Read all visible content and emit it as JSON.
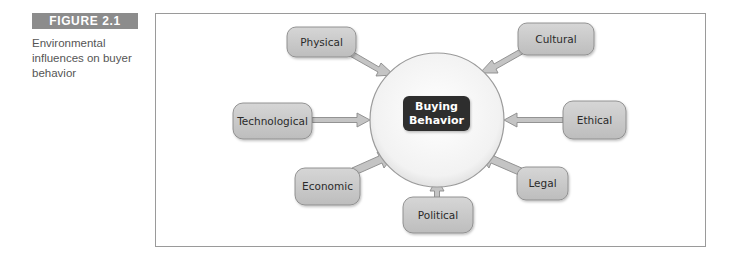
{
  "figure": {
    "label": "FIGURE 2.1",
    "caption": "Environmental influences on buyer behavior"
  },
  "diagram": {
    "center": {
      "line1": "Buying",
      "line2": "Behavior"
    },
    "influences": [
      {
        "id": "physical",
        "label": "Physical"
      },
      {
        "id": "cultural",
        "label": "Cultural"
      },
      {
        "id": "technological",
        "label": "Technological"
      },
      {
        "id": "ethical",
        "label": "Ethical"
      },
      {
        "id": "economic",
        "label": "Economic"
      },
      {
        "id": "legal",
        "label": "Legal"
      },
      {
        "id": "political",
        "label": "Political"
      }
    ]
  },
  "colors": {
    "label_bg": "#8c8c8c",
    "node_fill": "#c9c9c9",
    "node_stroke": "#8a8a8a",
    "center_fill": "#2f2f2f",
    "circle_stroke": "#9a9a9a",
    "arrow_fill": "#c4c4c4",
    "arrow_stroke": "#8a8a8a"
  }
}
